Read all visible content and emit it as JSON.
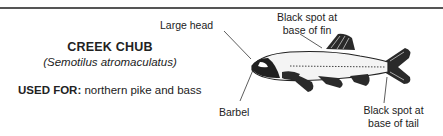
{
  "species": {
    "common_name": "CREEK CHUB",
    "scientific_name": "(Semotilus atromaculatus)",
    "used_for_label": "USED FOR:",
    "used_for_value": " northern pike and bass"
  },
  "annotations": {
    "large_head": "Large head",
    "black_spot_fin_line1": "Black spot at",
    "black_spot_fin_line2": "base of fin",
    "barbel": "Barbel",
    "black_spot_tail_line1": "Black spot at",
    "black_spot_tail_line2": "base of tail"
  },
  "colors": {
    "rule": "#555555",
    "text": "#222222",
    "fish_dark": "#1a1a1a"
  }
}
